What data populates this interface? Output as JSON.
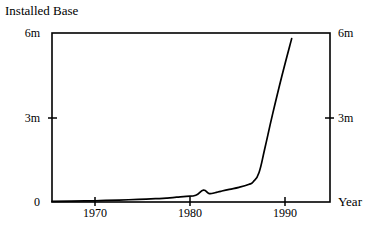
{
  "chart_data": {
    "type": "line",
    "title": "Installed Base",
    "xlabel": "Year",
    "ylabel": "",
    "xlim": [
      1965,
      1994
    ],
    "ylim": [
      0,
      6
    ],
    "grid": false,
    "legend": null,
    "y_tick_labels": [
      "0",
      "3m",
      "6m"
    ],
    "y_tick_values": [
      0,
      3,
      6
    ],
    "y_axis_right_tick_labels": [
      "3m",
      "6m"
    ],
    "y_axis_right_tick_values": [
      3,
      6
    ],
    "x_tick_labels": [
      "1970",
      "1980",
      "1990"
    ],
    "x_tick_values": [
      1970,
      1980,
      1990
    ],
    "series": [
      {
        "name": "Installed Base",
        "x": [
          1965,
          1967,
          1969,
          1970,
          1972,
          1974,
          1976,
          1977,
          1978,
          1979,
          1980,
          1980.8,
          1981.4,
          1982,
          1982.6,
          1983.5,
          1984.5,
          1985.5,
          1986,
          1986.6,
          1987.2,
          1988,
          1989,
          1990
        ],
        "values": [
          0.02,
          0.03,
          0.04,
          0.05,
          0.07,
          0.09,
          0.12,
          0.14,
          0.17,
          0.2,
          0.24,
          0.42,
          0.3,
          0.33,
          0.38,
          0.45,
          0.52,
          0.62,
          0.72,
          1.05,
          1.9,
          3.1,
          4.5,
          5.8
        ]
      }
    ]
  },
  "axes": {
    "title_text": "Installed Base",
    "year_label": "Year",
    "y_left": [
      {
        "label": "6m",
        "value": 6
      },
      {
        "label": "3m",
        "value": 3
      },
      {
        "label": "0",
        "value": 0
      }
    ],
    "y_right": [
      {
        "label": "6m",
        "value": 6
      },
      {
        "label": "3m",
        "value": 3
      }
    ],
    "x_ticks": [
      {
        "label": "1970",
        "value": 1970
      },
      {
        "label": "1980",
        "value": 1980
      },
      {
        "label": "1990",
        "value": 1990
      }
    ]
  },
  "style": {
    "line_color": "#000000",
    "axis_color": "#000000",
    "background": "#ffffff"
  }
}
